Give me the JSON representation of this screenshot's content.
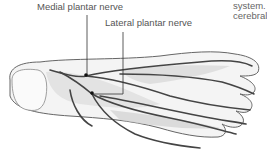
{
  "labels": {
    "medial": "Medial plantar nerve",
    "lateral": "Lateral plantar nerve"
  },
  "side_text": {
    "line1": "system. T",
    "line2": "cerebral g"
  },
  "illustration": {
    "subject": "plantar view of foot showing nerves",
    "stroke_color": "#444444",
    "background": "#ffffff"
  }
}
